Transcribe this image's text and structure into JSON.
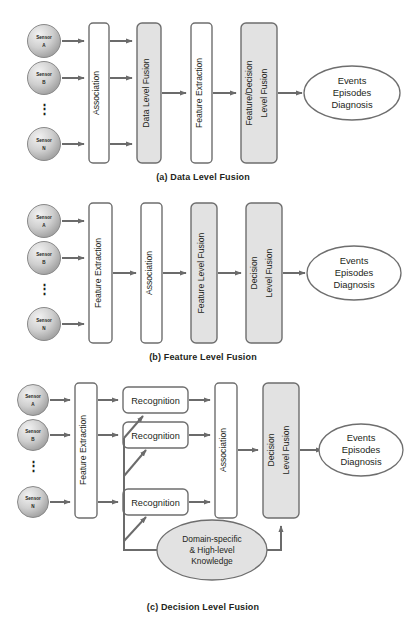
{
  "document": {
    "title": "Sensor Fusion Architectures",
    "type": "diagram-figure"
  },
  "style": {
    "fill_shaded": "#e2e2e2",
    "fill_white": "#ffffff",
    "stroke": "#6e6e6e",
    "arrow": "#6b6b6b",
    "text": "#231f20",
    "sensor_fill": "#c9c9c9"
  },
  "sensors": {
    "name": "Sensor",
    "labels": [
      "A",
      "B",
      "N"
    ],
    "ellipsis": "⋮"
  },
  "output_ellipse": {
    "line1": "Events",
    "line2": "Episodes",
    "line3": "Diagnosis"
  },
  "knowledge_ellipse": {
    "line1": "Domain-specific",
    "line2": "& High-level",
    "line3": "Knowledge"
  },
  "figures": [
    {
      "id": "a",
      "caption": "(a) Data Level Fusion",
      "stages": [
        {
          "label": "Association",
          "shaded": false
        },
        {
          "label": "Data Level Fusion",
          "shaded": true
        },
        {
          "label": "Feature Extraction",
          "shaded": false
        },
        {
          "label": "Feature/Decision\nLevel Fusion",
          "shaded": true
        }
      ],
      "stage_labels": [
        "Association",
        "Data Level Fusion",
        "Feature Extraction",
        "Feature/Decision",
        "Level Fusion"
      ]
    },
    {
      "id": "b",
      "caption": "(b) Feature Level Fusion",
      "stages": [
        {
          "label": "Feature Extraction",
          "shaded": false
        },
        {
          "label": "Association",
          "shaded": false
        },
        {
          "label": "Feature Level Fusion",
          "shaded": true
        },
        {
          "label": "Decision\nLevel Fusion",
          "shaded": true
        }
      ],
      "stage_labels": [
        "Feature Extraction",
        "Association",
        "Feature Level Fusion",
        "Decision",
        "Level Fusion"
      ]
    },
    {
      "id": "c",
      "caption": "(c) Decision Level Fusion",
      "stages": [
        {
          "label": "Feature Extraction",
          "shaded": false
        },
        {
          "label": "Recognition",
          "shaded": false
        },
        {
          "label": "Association",
          "shaded": false
        },
        {
          "label": "Decision\nLevel Fusion",
          "shaded": true
        }
      ],
      "stage_labels": [
        "Feature Extraction",
        "Recognition",
        "Association",
        "Decision",
        "Level Fusion"
      ],
      "recognition_label": "Recognition",
      "recognition_count": 3
    }
  ]
}
